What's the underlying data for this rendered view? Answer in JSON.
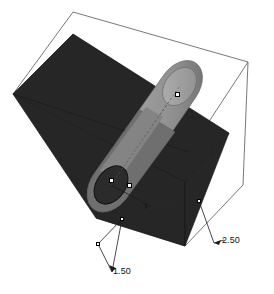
{
  "viewport": {
    "name": "3d-cad-viewport",
    "background_color": "#ffffff",
    "width": 274,
    "height": 294
  },
  "scene": {
    "bounding_box": {
      "name": "bounding-box-wireframe",
      "stroke_color": "#555555",
      "stroke_width": 0.8
    },
    "plane": {
      "name": "section-plane",
      "fill_color": "#262626",
      "stroke_color": "#111111",
      "label": "section plane"
    },
    "cylinder": {
      "name": "cylinder-solid",
      "body_color_light": "#9a9a9a",
      "body_color_mid": "#8a8a8a",
      "body_color_dark": "#6e6e6e",
      "cap_color": "#a5a5a5",
      "axis_color": "#5a5a5a",
      "outline_color": "#6a6a6a",
      "label": "cylinder"
    }
  },
  "dimensions": [
    {
      "name": "diameter-dimension",
      "value": "1.70",
      "symbol": "Ø1.70",
      "text": "Ø1.70",
      "color": "#2a2a2a",
      "placement": "on-plane"
    },
    {
      "name": "depth-dimension",
      "value": "2.50",
      "text": "2.50",
      "color": "#111111",
      "placement": "lower-right"
    },
    {
      "name": "height-dimension",
      "value": "1.50",
      "text": "1.50",
      "color": "#111111",
      "placement": "lower-left"
    }
  ],
  "handles": [
    {
      "name": "handle-cylinder-top",
      "x": 177,
      "y": 94
    },
    {
      "name": "handle-cylinder-base-center",
      "x": 111,
      "y": 180
    },
    {
      "name": "handle-cylinder-base-edge",
      "x": 129,
      "y": 185
    },
    {
      "name": "handle-plane-right-edge",
      "x": 199,
      "y": 201
    },
    {
      "name": "handle-dimension-node-upper",
      "x": 122,
      "y": 219
    },
    {
      "name": "handle-dimension-node-lower",
      "x": 98,
      "y": 244
    }
  ]
}
